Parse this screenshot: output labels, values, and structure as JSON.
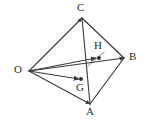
{
  "figure": {
    "kind": "geometry-diagram",
    "width": 148,
    "height": 125,
    "background_color": "#ffffff",
    "stroke_color": "#3a3a3a",
    "faint_stroke_color": "#b9b9b9",
    "label_color": "#2b2b2b",
    "vertices": [
      {
        "id": "O",
        "label": "O",
        "x": 29,
        "y": 71,
        "label_x": 14,
        "label_y": 65,
        "marked": false
      },
      {
        "id": "C",
        "label": "C",
        "x": 82,
        "y": 18,
        "label_x": 78,
        "label_y": 3,
        "marked": false
      },
      {
        "id": "B",
        "label": "B",
        "x": 124,
        "y": 58,
        "label_x": 129,
        "label_y": 52,
        "marked": false
      },
      {
        "id": "A",
        "label": "A",
        "x": 90,
        "y": 104,
        "label_x": 87,
        "label_y": 107,
        "marked": false
      }
    ],
    "interior_points": [
      {
        "id": "G",
        "label": "G",
        "x": 81,
        "y": 79,
        "label_x": 77,
        "label_y": 83,
        "marked": true
      },
      {
        "id": "H",
        "label": "H",
        "x": 99,
        "y": 58,
        "label_x": 95,
        "label_y": 41,
        "marked": true
      }
    ],
    "edges": [
      {
        "id": "O-C",
        "from": "O",
        "to": "C",
        "style": "solid"
      },
      {
        "id": "O-A",
        "from": "O",
        "to": "A",
        "style": "solid"
      },
      {
        "id": "C-B",
        "from": "C",
        "to": "B",
        "style": "solid"
      },
      {
        "id": "C-A",
        "from": "C",
        "to": "A",
        "style": "solid"
      },
      {
        "id": "A-B",
        "from": "A",
        "to": "B",
        "style": "solid"
      },
      {
        "id": "O-B",
        "from": "O",
        "to": "B",
        "style": "solid"
      }
    ],
    "vectors": [
      {
        "id": "OG",
        "from": "O",
        "to": "G",
        "arrow": true,
        "label": ""
      },
      {
        "id": "OH",
        "from": "O",
        "to": "H",
        "arrow": true,
        "label": ""
      }
    ],
    "faint_lines": [
      {
        "id": "faint-through-H",
        "x1": 88,
        "y1": 66,
        "x2": 104,
        "y2": 52
      }
    ]
  }
}
